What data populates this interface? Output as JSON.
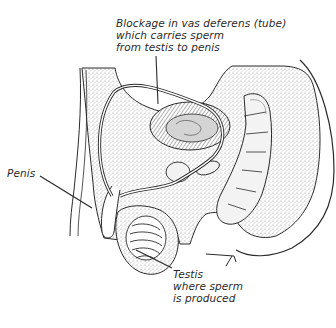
{
  "figure": {
    "style": "black-and-white stippled line illustration",
    "colors": {
      "background": "#ffffff",
      "ink": "#2a2a2a",
      "stipple": "#bdbdbd"
    }
  },
  "labels": {
    "blockage": {
      "lines": [
        "Blockage in vas deferens (tube)",
        "which carries sperm",
        "from testis to penis"
      ]
    },
    "penis": {
      "lines": [
        "Penis"
      ]
    },
    "testis": {
      "lines": [
        "Testis",
        "where sperm",
        "is produced"
      ]
    }
  }
}
